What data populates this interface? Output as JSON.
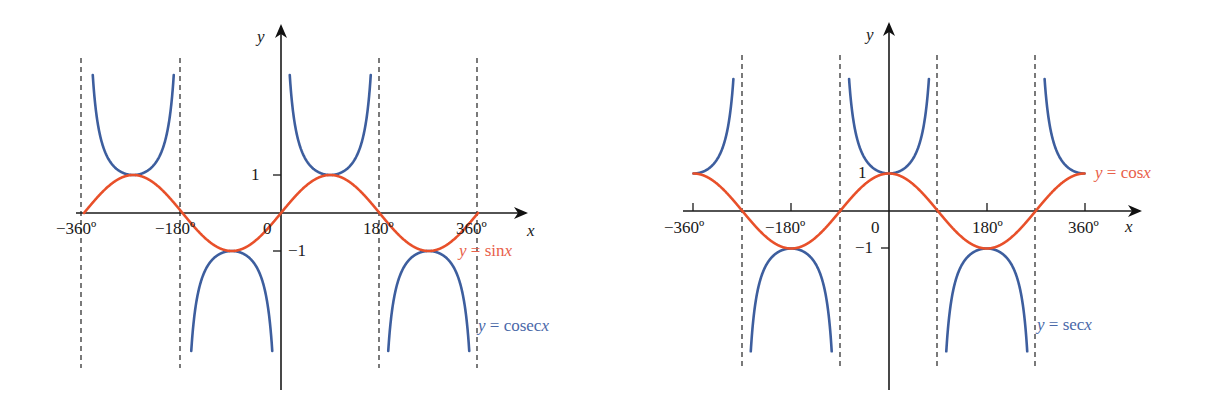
{
  "chart_data": [
    {
      "type": "line",
      "title": "",
      "xlabel": "x",
      "ylabel": "y",
      "xlim": [
        -360,
        360
      ],
      "ylim": [
        -4.5,
        3.8
      ],
      "x_tick_labels": [
        "-360º",
        "-180º",
        "0",
        "180º",
        "360º"
      ],
      "x_ticks": [
        -360,
        -180,
        0,
        180,
        360
      ],
      "y_tick_labels": [
        "1",
        "-1"
      ],
      "y_ticks": [
        1,
        -1
      ],
      "asymptotes": [
        -360,
        -180,
        180,
        360
      ],
      "grid": false,
      "series": [
        {
          "name": "y = sin x",
          "function": "sin",
          "color": "#e8502a",
          "x": [
            -360,
            -270,
            -180,
            -90,
            0,
            90,
            180,
            270,
            360
          ],
          "values": [
            0,
            1,
            0,
            -1,
            0,
            1,
            0,
            -1,
            0
          ]
        },
        {
          "name": "y = cosec x",
          "function": "cosec",
          "color": "#3d5e9e",
          "x": [
            -270,
            -90,
            90,
            270
          ],
          "values": [
            1,
            -1,
            1,
            -1
          ]
        }
      ],
      "legend": [
        {
          "label": "y = sin x",
          "color": "#e8502a"
        },
        {
          "label": "y = cosec x",
          "color": "#3d5e9e"
        }
      ]
    },
    {
      "type": "line",
      "title": "",
      "xlabel": "x",
      "ylabel": "y",
      "xlim": [
        -360,
        360
      ],
      "ylim": [
        -4.6,
        3.8
      ],
      "x_tick_labels": [
        "-360º",
        "-180º",
        "0",
        "180º",
        "360º"
      ],
      "x_ticks": [
        -360,
        -180,
        0,
        180,
        360
      ],
      "y_tick_labels": [
        "1",
        "-1"
      ],
      "y_ticks": [
        1,
        -1
      ],
      "asymptotes": [
        -270,
        -90,
        90,
        270
      ],
      "grid": false,
      "series": [
        {
          "name": "y = cos x",
          "function": "cos",
          "color": "#e8502a",
          "x": [
            -360,
            -270,
            -180,
            -90,
            0,
            90,
            180,
            270,
            360
          ],
          "values": [
            1,
            0,
            -1,
            0,
            1,
            0,
            -1,
            0,
            1
          ]
        },
        {
          "name": "y = sec x",
          "function": "sec",
          "color": "#3d5e9e",
          "x": [
            -360,
            -180,
            0,
            180,
            360
          ],
          "values": [
            1,
            -1,
            1,
            -1,
            1
          ]
        }
      ],
      "legend": [
        {
          "label": "y = cos x",
          "color": "#e8502a"
        },
        {
          "label": "y = sec x",
          "color": "#3d5e9e"
        }
      ]
    }
  ],
  "left": {
    "y_axis_label": "y",
    "x_axis_label": "x",
    "tick_neg360": "−360º",
    "tick_neg180": "−180º",
    "tick_zero": "0",
    "tick_180": "180º",
    "tick_360": "360º",
    "tick_one": "1",
    "tick_neg_one": "−1",
    "sin_label_prefix": "y",
    "sin_label_rest": " = sin",
    "sin_label_var": "x",
    "cosec_label_prefix": "y",
    "cosec_label_rest": " = cosec",
    "cosec_label_var": "x"
  },
  "right": {
    "y_axis_label": "y",
    "x_axis_label": "x",
    "tick_neg360": "−360º",
    "tick_neg180": "−180º",
    "tick_zero": "0",
    "tick_180": "180º",
    "tick_360": "360º",
    "tick_one": "1",
    "tick_neg_one": "−1",
    "cos_label_prefix": "y",
    "cos_label_rest": " = cos",
    "cos_label_var": "x",
    "sec_label_prefix": "y",
    "sec_label_rest": " = sec",
    "sec_label_var": "x"
  },
  "colors": {
    "red": "#e8502a",
    "blue": "#3d5e9e",
    "red_label": "#e8604a",
    "blue_label": "#4a68a8"
  }
}
